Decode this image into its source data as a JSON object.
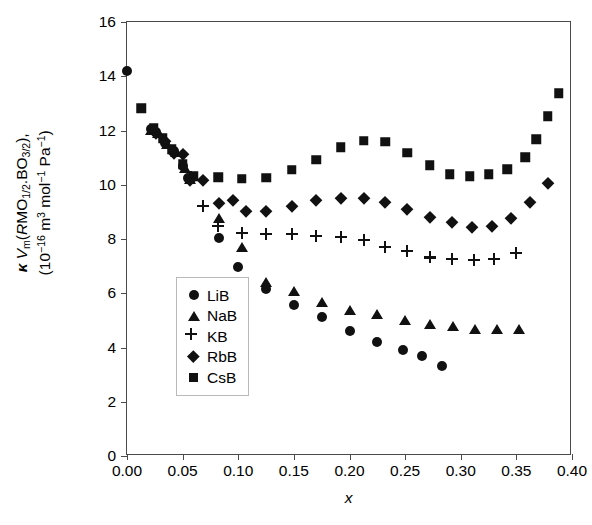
{
  "axes": {
    "y_label_line1": "κ V_m(RMO_1/2.BO_3/2),",
    "y_label_line2": "(10^-16 m^3 mol^-1 Pa^-1)",
    "x_label": "x",
    "y_ticks": [
      "0",
      "2",
      "4",
      "6",
      "8",
      "10",
      "12",
      "14",
      "16"
    ],
    "x_ticks": [
      "0.00",
      "0.05",
      "0.10",
      "0.15",
      "0.20",
      "0.25",
      "0.30",
      "0.35",
      "0.40"
    ],
    "ylim": [
      0,
      16
    ],
    "xlim": [
      0.0,
      0.4
    ],
    "grid": false,
    "frame_color": "#4a4a4a"
  },
  "legend": {
    "position": "inner-lower-left",
    "entries": [
      {
        "label": "LiB",
        "marker": "circle"
      },
      {
        "label": "NaB",
        "marker": "triangle"
      },
      {
        "label": "KB",
        "marker": "plus"
      },
      {
        "label": "RbB",
        "marker": "diamond"
      },
      {
        "label": "CsB",
        "marker": "square"
      }
    ]
  },
  "chart_data": {
    "type": "scatter",
    "title": "",
    "xlabel": "x",
    "ylabel": "κ V_m(RMO_1/2.BO_3/2), (10^-16 m^3 mol^-1 Pa^-1)",
    "xlim": [
      0.0,
      0.4
    ],
    "ylim": [
      0,
      16
    ],
    "grid": false,
    "legend_position": "inner-lower-left",
    "marker_color": "#111111",
    "series": [
      {
        "name": "LiB",
        "marker": "circle",
        "points": [
          [
            0.0,
            14.2
          ],
          [
            0.022,
            12.05
          ],
          [
            0.026,
            11.95
          ],
          [
            0.034,
            11.55
          ],
          [
            0.042,
            11.25
          ],
          [
            0.05,
            10.7
          ],
          [
            0.055,
            10.25
          ],
          [
            0.083,
            8.05
          ],
          [
            0.1,
            6.98
          ],
          [
            0.125,
            6.15
          ],
          [
            0.15,
            5.55
          ],
          [
            0.175,
            5.12
          ],
          [
            0.2,
            4.62
          ],
          [
            0.225,
            4.22
          ],
          [
            0.248,
            3.92
          ],
          [
            0.265,
            3.68
          ],
          [
            0.283,
            3.3
          ]
        ]
      },
      {
        "name": "NaB",
        "marker": "triangle",
        "points": [
          [
            0.022,
            12.02
          ],
          [
            0.028,
            11.9
          ],
          [
            0.036,
            11.52
          ],
          [
            0.044,
            11.22
          ],
          [
            0.052,
            10.62
          ],
          [
            0.057,
            10.22
          ],
          [
            0.083,
            8.78
          ],
          [
            0.103,
            7.7
          ],
          [
            0.125,
            6.42
          ],
          [
            0.15,
            6.08
          ],
          [
            0.175,
            5.68
          ],
          [
            0.2,
            5.38
          ],
          [
            0.225,
            5.22
          ],
          [
            0.25,
            5.0
          ],
          [
            0.272,
            4.85
          ],
          [
            0.293,
            4.78
          ],
          [
            0.313,
            4.7
          ],
          [
            0.333,
            4.68
          ],
          [
            0.352,
            4.68
          ]
        ]
      },
      {
        "name": "KB",
        "marker": "plus",
        "points": [
          [
            0.057,
            10.28
          ],
          [
            0.068,
            9.22
          ],
          [
            0.082,
            8.48
          ],
          [
            0.103,
            8.22
          ],
          [
            0.125,
            8.2
          ],
          [
            0.148,
            8.18
          ],
          [
            0.17,
            8.12
          ],
          [
            0.192,
            8.08
          ],
          [
            0.213,
            7.98
          ],
          [
            0.232,
            7.72
          ],
          [
            0.252,
            7.55
          ],
          [
            0.272,
            7.32
          ],
          [
            0.292,
            7.25
          ],
          [
            0.312,
            7.22
          ],
          [
            0.33,
            7.25
          ],
          [
            0.35,
            7.48
          ]
        ]
      },
      {
        "name": "RbB",
        "marker": "diamond",
        "points": [
          [
            0.026,
            11.92
          ],
          [
            0.034,
            11.62
          ],
          [
            0.042,
            11.18
          ],
          [
            0.05,
            11.12
          ],
          [
            0.057,
            10.18
          ],
          [
            0.068,
            10.18
          ],
          [
            0.083,
            9.32
          ],
          [
            0.095,
            9.42
          ],
          [
            0.107,
            9.05
          ],
          [
            0.125,
            9.05
          ],
          [
            0.148,
            9.22
          ],
          [
            0.17,
            9.42
          ],
          [
            0.192,
            9.52
          ],
          [
            0.213,
            9.5
          ],
          [
            0.232,
            9.38
          ],
          [
            0.252,
            9.1
          ],
          [
            0.272,
            8.82
          ],
          [
            0.292,
            8.62
          ],
          [
            0.31,
            8.45
          ],
          [
            0.328,
            8.48
          ],
          [
            0.345,
            8.78
          ],
          [
            0.362,
            9.38
          ],
          [
            0.378,
            10.08
          ]
        ]
      },
      {
        "name": "CsB",
        "marker": "square",
        "points": [
          [
            0.013,
            12.82
          ],
          [
            0.024,
            12.1
          ],
          [
            0.032,
            11.72
          ],
          [
            0.04,
            11.3
          ],
          [
            0.05,
            10.75
          ],
          [
            0.06,
            10.32
          ],
          [
            0.082,
            10.28
          ],
          [
            0.103,
            10.22
          ],
          [
            0.125,
            10.25
          ],
          [
            0.148,
            10.55
          ],
          [
            0.17,
            10.92
          ],
          [
            0.192,
            11.38
          ],
          [
            0.213,
            11.62
          ],
          [
            0.232,
            11.58
          ],
          [
            0.252,
            11.18
          ],
          [
            0.272,
            10.72
          ],
          [
            0.29,
            10.38
          ],
          [
            0.308,
            10.32
          ],
          [
            0.325,
            10.38
          ],
          [
            0.342,
            10.58
          ],
          [
            0.358,
            11.02
          ],
          [
            0.368,
            11.68
          ],
          [
            0.378,
            12.52
          ],
          [
            0.388,
            13.38
          ]
        ]
      }
    ]
  }
}
